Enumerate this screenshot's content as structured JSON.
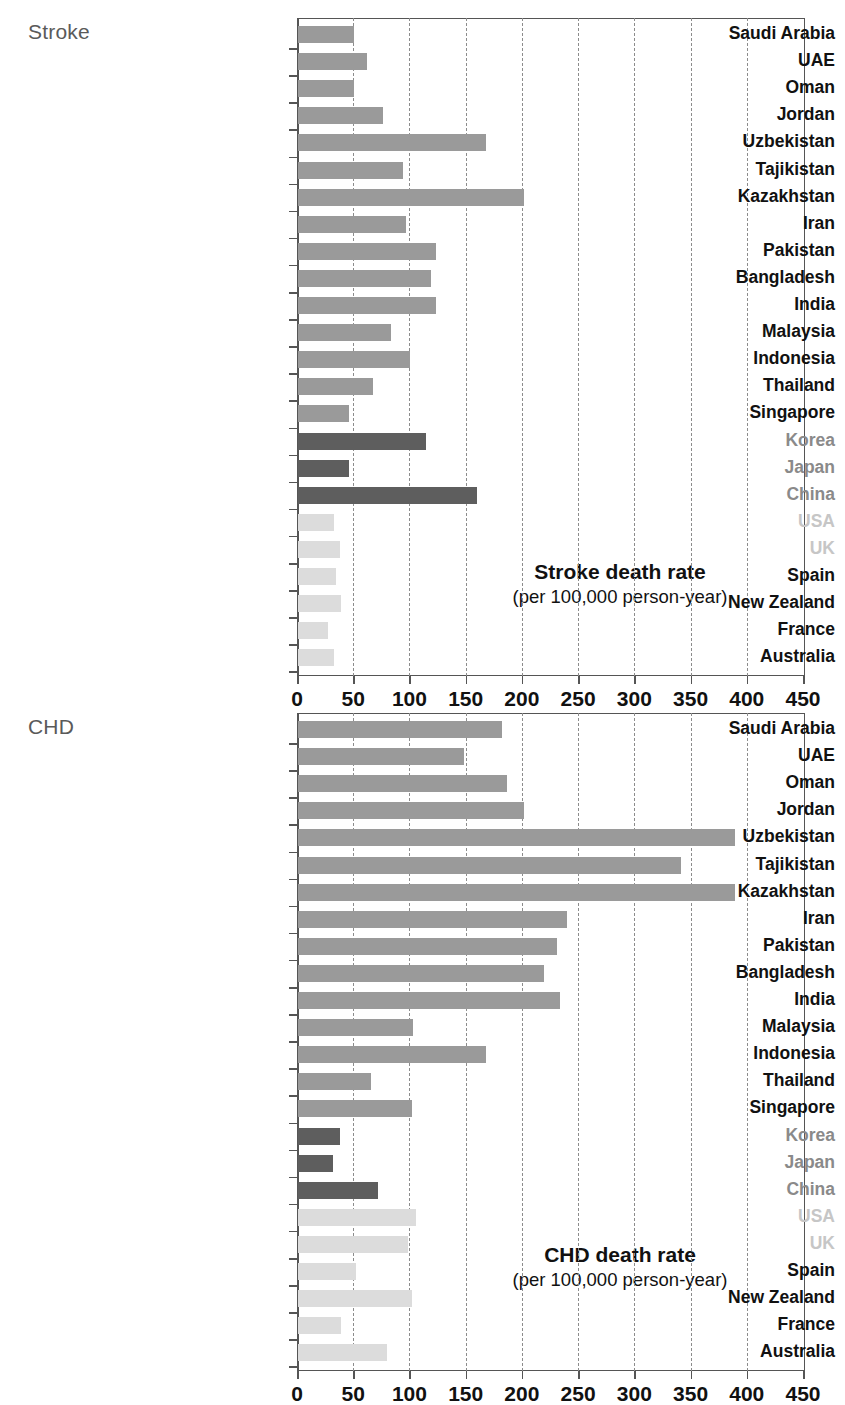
{
  "figure": {
    "panels": [
      {
        "id": "stroke",
        "caption": "Stroke",
        "annotation_line1": "Stroke death rate",
        "annotation_line2": "(per 100,000 person-year)"
      },
      {
        "id": "chd",
        "caption": "CHD",
        "annotation_line1": "CHD death rate",
        "annotation_line2": "(per 100,000 person-year)"
      }
    ],
    "axis": {
      "ticks": [
        "0",
        "50",
        "100",
        "150",
        "200",
        "250",
        "300",
        "350",
        "400",
        "450"
      ]
    },
    "colors": {
      "bar_mid_gray": "#9a9a9a",
      "bar_dark_gray": "#5e5e5e",
      "bar_light_gray": "#dcdcdc",
      "label_black": "#111111",
      "label_mid_gray": "#8a8a8a",
      "label_light_gray": "#c6c6c6",
      "caption_gray": "#5a5a5a",
      "axis_gray": "#555555",
      "grid_gray": "#8c8c8c"
    }
  },
  "chart_data": [
    {
      "type": "bar",
      "orientation": "horizontal",
      "title": "Stroke death rate",
      "subtitle": "(per 100,000 person-year)",
      "panel_label": "Stroke",
      "xlabel": "Stroke death rate (per 100,000 person-year)",
      "ylabel": "",
      "xlim": [
        0,
        450
      ],
      "xticks": [
        0,
        50,
        100,
        150,
        200,
        250,
        300,
        350,
        400,
        450
      ],
      "grid": "vertical-dashed",
      "legend": "none",
      "categories": [
        "Saudi Arabia",
        "UAE",
        "Oman",
        "Jordan",
        "Uzbekistan",
        "Tajikistan",
        "Kazakhstan",
        "Iran",
        "Pakistan",
        "Bangladesh",
        "India",
        "Malaysia",
        "Indonesia",
        "Thailand",
        "Singapore",
        "Korea",
        "Japan",
        "China",
        "USA",
        "UK",
        "Spain",
        "New Zealand",
        "France",
        "Australia"
      ],
      "values": [
        50,
        61,
        50,
        76,
        167,
        93,
        201,
        96,
        123,
        118,
        123,
        83,
        100,
        67,
        45,
        114,
        45,
        159,
        32,
        37,
        34,
        38,
        27,
        32
      ],
      "bar_groups": [
        "mid",
        "mid",
        "mid",
        "mid",
        "mid",
        "mid",
        "mid",
        "mid",
        "mid",
        "mid",
        "mid",
        "mid",
        "mid",
        "mid",
        "mid",
        "dark",
        "dark",
        "dark",
        "light",
        "light",
        "light",
        "light",
        "light",
        "light"
      ],
      "label_groups": [
        "black",
        "black",
        "black",
        "black",
        "black",
        "black",
        "black",
        "black",
        "black",
        "black",
        "black",
        "black",
        "black",
        "black",
        "black",
        "gray",
        "gray",
        "gray",
        "lightgray",
        "lightgray",
        "black",
        "black",
        "black",
        "black"
      ]
    },
    {
      "type": "bar",
      "orientation": "horizontal",
      "title": "CHD death rate",
      "subtitle": "(per 100,000 person-year)",
      "panel_label": "CHD",
      "xlabel": "CHD death rate (per 100,000 person-year)",
      "ylabel": "",
      "xlim": [
        0,
        450
      ],
      "xticks": [
        0,
        50,
        100,
        150,
        200,
        250,
        300,
        350,
        400,
        450
      ],
      "grid": "vertical-dashed",
      "legend": "none",
      "categories": [
        "Saudi Arabia",
        "UAE",
        "Oman",
        "Jordan",
        "Uzbekistan",
        "Tajikistan",
        "Kazakhstan",
        "Iran",
        "Pakistan",
        "Bangladesh",
        "India",
        "Malaysia",
        "Indonesia",
        "Thailand",
        "Singapore",
        "Korea",
        "Japan",
        "China",
        "USA",
        "UK",
        "Spain",
        "New Zealand",
        "France",
        "Australia"
      ],
      "values": [
        181,
        148,
        186,
        201,
        389,
        341,
        389,
        239,
        230,
        219,
        233,
        102,
        167,
        65,
        101,
        37,
        31,
        71,
        105,
        98,
        52,
        101,
        38,
        79
      ],
      "bar_groups": [
        "mid",
        "mid",
        "mid",
        "mid",
        "mid",
        "mid",
        "mid",
        "mid",
        "mid",
        "mid",
        "mid",
        "mid",
        "mid",
        "mid",
        "mid",
        "dark",
        "dark",
        "dark",
        "light",
        "light",
        "light",
        "light",
        "light",
        "light"
      ],
      "label_groups": [
        "black",
        "black",
        "black",
        "black",
        "black",
        "black",
        "black",
        "black",
        "black",
        "black",
        "black",
        "black",
        "black",
        "black",
        "black",
        "gray",
        "gray",
        "gray",
        "lightgray",
        "lightgray",
        "black",
        "black",
        "black",
        "black"
      ]
    }
  ]
}
